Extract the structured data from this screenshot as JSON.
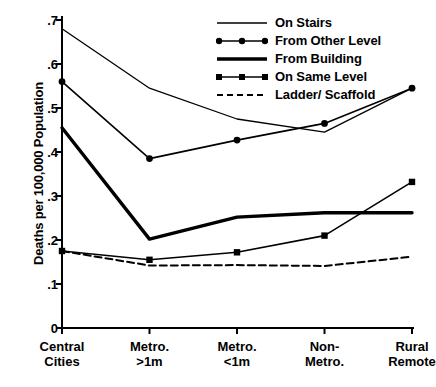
{
  "chart_data": {
    "type": "line",
    "title": "",
    "xlabel": "",
    "ylabel": "Deaths per 100,000 Population",
    "categories": [
      "Central\nCities",
      "Metro.\n>1m",
      "Metro.\n<1m",
      "Non-\nMetro.",
      "Rural\nRemote"
    ],
    "category_lines": [
      [
        "Central",
        "Cities"
      ],
      [
        "Metro.",
        ">1m"
      ],
      [
        "Metro.",
        "<1m"
      ],
      [
        "Non-",
        "Metro."
      ],
      [
        "Rural",
        "Remote"
      ]
    ],
    "ylim": [
      0,
      0.7
    ],
    "yticks": [
      0,
      0.1,
      0.2,
      0.3,
      0.4,
      0.5,
      0.6,
      0.7
    ],
    "ytick_labels": [
      "0",
      ".1",
      ".2",
      ".3",
      ".4",
      ".5",
      ".6",
      ".7"
    ],
    "grid": false,
    "legend_position": "top-right",
    "series": [
      {
        "name": "On Stairs",
        "values": [
          0.68,
          0.545,
          0.475,
          0.445,
          0.545
        ],
        "marker": "none",
        "style": "solid",
        "width": 1.3,
        "color": "#000000"
      },
      {
        "name": "From Other Level",
        "values": [
          0.56,
          0.385,
          0.427,
          0.465,
          0.545
        ],
        "marker": "circle",
        "style": "solid",
        "width": 1.6,
        "color": "#000000"
      },
      {
        "name": "From Building",
        "values": [
          0.455,
          0.202,
          0.252,
          0.262,
          0.262
        ],
        "marker": "none",
        "style": "solid",
        "width": 3.4,
        "color": "#000000"
      },
      {
        "name": "On Same Level",
        "values": [
          0.175,
          0.155,
          0.172,
          0.21,
          0.332
        ],
        "marker": "square",
        "style": "solid",
        "width": 1.6,
        "color": "#000000"
      },
      {
        "name": "Ladder/ Scaffold",
        "values": [
          0.175,
          0.142,
          0.143,
          0.141,
          0.162
        ],
        "marker": "none",
        "style": "dashed",
        "width": 2.0,
        "color": "#000000"
      }
    ]
  },
  "axes": {
    "y_axis_name": "y-axis",
    "x_axis_name": "x-axis"
  }
}
